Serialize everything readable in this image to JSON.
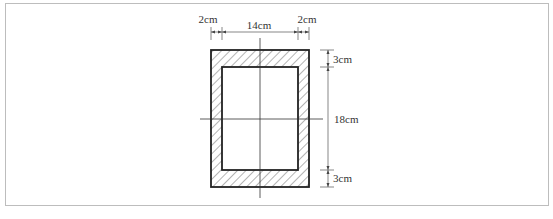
{
  "figure": {
    "dimensions": {
      "left_wall": "2cm",
      "inner_width": "14cm",
      "right_wall": "2cm",
      "top_wall": "3cm",
      "inner_height": "18cm",
      "bottom_wall": "3cm"
    },
    "colors": {
      "line": "#222222",
      "dim_line": "#555555",
      "frame": "#bdbdbd"
    }
  }
}
